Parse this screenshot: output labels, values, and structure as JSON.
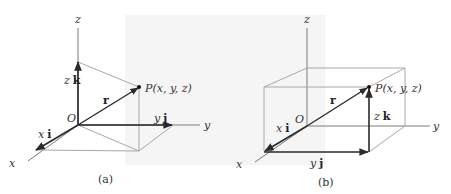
{
  "figure_a": {
    "caption": "(a)",
    "axes": {
      "x": "x",
      "y": "y",
      "z": "z"
    },
    "origin": "O",
    "point": "P(x, y, z)",
    "vector": "r",
    "components": {
      "x": {
        "scalar": "x",
        "unit": "i"
      },
      "y": {
        "scalar": "y",
        "unit": "j"
      },
      "z": {
        "scalar": "z",
        "unit": "k"
      }
    }
  },
  "figure_b": {
    "caption": "(b)",
    "axes": {
      "x": "x",
      "y": "y",
      "z": "z"
    },
    "origin": "O",
    "point": "P(x, y, z)",
    "vector": "r",
    "components": {
      "x": {
        "scalar": "x",
        "unit": "i"
      },
      "y": {
        "scalar": "y",
        "unit": "j"
      },
      "z": {
        "scalar": "z",
        "unit": "k"
      }
    }
  },
  "colors": {
    "axis": "#7a7a7a",
    "construction": "#a8a8a8",
    "vector": "#2a2a2a",
    "background_shade": "#f3f3f3"
  }
}
